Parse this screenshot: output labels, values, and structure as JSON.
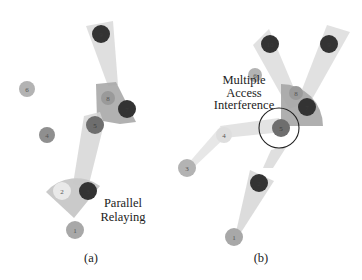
{
  "figure": {
    "panels": [
      {
        "id": "a",
        "caption": "(a)",
        "caption_pos": [
          91,
          262
        ],
        "annotation": {
          "lines": [
            "Parallel",
            "Relaying"
          ],
          "pos": [
            123,
            207
          ],
          "line_height": 14
        },
        "beams": [
          {
            "points": "86,26 113,21 118,85 108,86",
            "fill": "#d9d9d9",
            "opacity": 0.85
          },
          {
            "points": "96,84 116,82 136,122 120,124 97,120",
            "fill": "#a8a8a8",
            "opacity": 0.9
          },
          {
            "points": "84,116 100,112 104,124 88,188 73,184",
            "fill": "#d6d6d6",
            "opacity": 0.85
          },
          {
            "points": "73,314 ",
            "fill": "#d6d6d6",
            "opacity": 0
          },
          {
            "path": "M 74 218 L 46 192 A 40 40 0 0 1 100 186 Z",
            "fill": "#c7c7c7",
            "opacity": 0.95
          }
        ],
        "nodes": [
          {
            "id": "1",
            "x": 75,
            "y": 230,
            "r": 9,
            "fill": "#a8a8a8"
          },
          {
            "id": "2",
            "x": 62,
            "y": 191,
            "r": 9,
            "fill": "#e9e9e9"
          },
          {
            "id": "3",
            "x": 88,
            "y": 191,
            "r": 9,
            "fill": "#333333"
          },
          {
            "id": "4",
            "x": 47,
            "y": 135,
            "r": 8,
            "fill": "#8f8f8f"
          },
          {
            "id": "5",
            "x": 95,
            "y": 125,
            "r": 9,
            "fill": "#6e6e6e"
          },
          {
            "id": "6",
            "x": 27,
            "y": 89,
            "r": 8,
            "fill": "#b3b3b3"
          },
          {
            "id": "7",
            "x": 127,
            "y": 109,
            "r": 9,
            "fill": "#333333"
          },
          {
            "id": "8",
            "x": 108,
            "y": 98,
            "r": 7,
            "fill": "#9a9a9a"
          },
          {
            "id": "9",
            "x": 101,
            "y": 34,
            "r": 9,
            "fill": "#333333"
          }
        ]
      },
      {
        "id": "b",
        "caption": "(b)",
        "caption_pos": [
          261,
          262
        ],
        "annotation": {
          "lines": [
            "Multiple",
            "Access",
            "Interference"
          ],
          "pos": [
            244,
            84
          ],
          "line_height": 12.5
        },
        "interference_circle": {
          "x": 279,
          "y": 128,
          "r": 20,
          "stroke": "#222222"
        },
        "beams": [
          {
            "points": "253,45 269,29 301,105 289,109",
            "fill": "#dcdcdc",
            "opacity": 0.85
          },
          {
            "points": "327,25 350,32 306,110 296,105",
            "fill": "#dcdcdc",
            "opacity": 0.85
          },
          {
            "path": "M 281 90 L 281 126 L 323 126 A 42 42 0 0 0 281 84 Z",
            "fill": "#a6a6a6",
            "opacity": 0.9
          },
          {
            "points": "220,126 224,138 283,132 279,118",
            "fill": "#dedede",
            "opacity": 0.85
          },
          {
            "points": "186,166 220,127 229,134 191,170",
            "fill": "#e3e3e3",
            "opacity": 0.85
          },
          {
            "points": "271,150 287,146 273,168 263,168",
            "fill": "#d9d9d9",
            "opacity": 0.85
          },
          {
            "points": "250,170 274,181 240,234 236,232",
            "fill": "#d6d6d6",
            "opacity": 0.85
          }
        ],
        "nodes": [
          {
            "id": "1",
            "x": 234,
            "y": 237,
            "r": 9,
            "fill": "#a8a8a8"
          },
          {
            "id": "2",
            "x": 259,
            "y": 183,
            "r": 9,
            "fill": "#333333"
          },
          {
            "id": "3",
            "x": 187,
            "y": 168,
            "r": 9,
            "fill": "#b3b3b3"
          },
          {
            "id": "4",
            "x": 224,
            "y": 135,
            "r": 8,
            "fill": "#dedede"
          },
          {
            "id": "5",
            "x": 281,
            "y": 128,
            "r": 9,
            "fill": "#6e6e6e"
          },
          {
            "id": "6",
            "x": 255,
            "y": 75,
            "r": 7,
            "fill": "#b3b3b3"
          },
          {
            "id": "7",
            "x": 307,
            "y": 107,
            "r": 9,
            "fill": "#333333"
          },
          {
            "id": "8",
            "x": 296,
            "y": 93,
            "r": 7,
            "fill": "#9a9a9a"
          },
          {
            "id": "9",
            "x": 329,
            "y": 44,
            "r": 9,
            "fill": "#333333"
          },
          {
            "id": "10",
            "x": 270,
            "y": 44,
            "r": 9,
            "fill": "#333333"
          }
        ]
      }
    ]
  }
}
